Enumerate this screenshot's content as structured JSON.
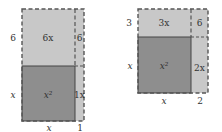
{
  "colors": {
    "light": "#c8c8c8",
    "dark": "#8e8e8e",
    "line": "#444444",
    "text": "#333333"
  },
  "figures": [
    {
      "name": "left-figure",
      "regions": {
        "top_area": "6x",
        "square_area": "x²",
        "right_strip_top": "6",
        "right_strip_bottom": "1x"
      },
      "side_labels": {
        "left_top": "6",
        "left_bottom": "x",
        "bottom_left": "x",
        "bottom_right": "1"
      }
    },
    {
      "name": "right-figure",
      "regions": {
        "top_area": "3x",
        "square_area": "x²",
        "corner": "6",
        "right_strip": "2x"
      },
      "side_labels": {
        "left_top": "3",
        "left_bottom": "x",
        "bottom_left": "x",
        "bottom_right": "2"
      }
    }
  ]
}
